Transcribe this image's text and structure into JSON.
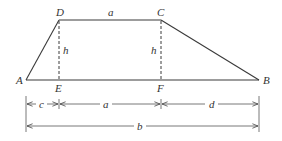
{
  "diagram": {
    "colors": {
      "stroke": "#3a3a3a",
      "label": "#333333",
      "background": "#ffffff"
    },
    "vertices": {
      "A": {
        "label": "A",
        "x": 26,
        "y": 80
      },
      "B": {
        "label": "B",
        "x": 259,
        "y": 80
      },
      "C": {
        "label": "C",
        "x": 161,
        "y": 20
      },
      "D": {
        "label": "D",
        "x": 59,
        "y": 20
      },
      "E": {
        "label": "E",
        "x": 59,
        "y": 80
      },
      "F": {
        "label": "F",
        "x": 161,
        "y": 80
      }
    },
    "edge_labels": {
      "top": "a",
      "height_left": "h",
      "height_right": "h"
    },
    "dimensions": {
      "row1": [
        {
          "label": "c",
          "from": "A",
          "to": "E"
        },
        {
          "label": "a",
          "from": "E",
          "to": "F"
        },
        {
          "label": "d",
          "from": "F",
          "to": "B"
        }
      ],
      "row2": [
        {
          "label": "b",
          "from": "A",
          "to": "B"
        }
      ]
    }
  }
}
